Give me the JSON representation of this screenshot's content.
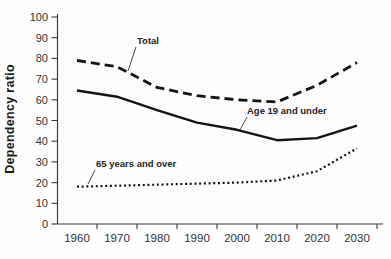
{
  "chart_data": {
    "type": "line",
    "title": "",
    "xlabel": "",
    "ylabel": "Dependency ratio",
    "x": [
      1960,
      1970,
      1980,
      1990,
      2000,
      2010,
      2020,
      2030
    ],
    "ylim": [
      0,
      100
    ],
    "ytick_step": 10,
    "grid": false,
    "legend_position": "inline-annotations",
    "series": [
      {
        "name": "Total",
        "style": "dashed",
        "values": [
          79,
          76,
          66,
          62,
          60,
          59,
          67,
          78
        ]
      },
      {
        "name": "Age 19 and under",
        "style": "solid",
        "values": [
          64.5,
          61.5,
          55,
          49,
          45.5,
          40.5,
          41.5,
          47.5
        ]
      },
      {
        "name": "65 years and over",
        "style": "dotted",
        "values": [
          18,
          18.5,
          19,
          19.5,
          20,
          21,
          25.5,
          36.5
        ]
      }
    ],
    "annotations": [
      {
        "text": "Total",
        "series": "dashed"
      },
      {
        "text": "Age 19 and under",
        "series": "solid"
      },
      {
        "text": "65 years and over",
        "series": "dotted"
      }
    ]
  },
  "colors": {
    "line": "#151515",
    "text": "#353535",
    "background": "#fdfdfd"
  }
}
